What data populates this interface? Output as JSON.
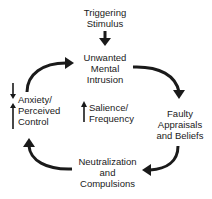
{
  "diagram": {
    "type": "cycle",
    "nodes": {
      "trigger": {
        "lines": [
          "Triggering",
          "Stimulus"
        ]
      },
      "intrusion": {
        "lines": [
          "Unwanted",
          "Mental",
          "Intrusion"
        ]
      },
      "appraisals": {
        "lines": [
          "Faulty",
          "Appraisals",
          "and Beliefs"
        ]
      },
      "neutralization": {
        "lines": [
          "Neutralization",
          "and",
          "Compulsions"
        ]
      },
      "anxiety": {
        "lines": [
          "Anxiety/",
          "Perceived",
          "Control"
        ],
        "indicators": [
          "down",
          "up"
        ]
      },
      "salience": {
        "lines": [
          "Salience/",
          "Frequency"
        ],
        "indicator": "up"
      }
    },
    "edges": [
      {
        "from": "trigger",
        "to": "intrusion"
      },
      {
        "from": "intrusion",
        "to": "appraisals"
      },
      {
        "from": "appraisals",
        "to": "neutralization"
      },
      {
        "from": "neutralization",
        "to": "anxiety"
      },
      {
        "from": "anxiety",
        "to": "intrusion"
      }
    ],
    "colors": {
      "ink": "#1a1a1a",
      "background": "#ffffff"
    }
  }
}
